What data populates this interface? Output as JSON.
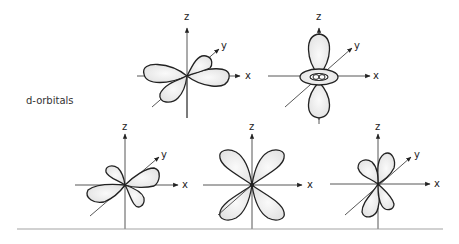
{
  "figure": {
    "side_label": "d-orbitals",
    "baseline_color": "#999999",
    "line_color": "#222222",
    "fill_color": "#eeeeee",
    "orbitals": [
      {
        "id": "d-xy-top",
        "axis_labels": {
          "z": "z",
          "y": "y",
          "x": "x"
        }
      },
      {
        "id": "d-z2",
        "axis_labels": {
          "z": "z",
          "y": "y",
          "x": "x"
        }
      },
      {
        "id": "d-xz",
        "axis_labels": {
          "z": "z",
          "y": "y",
          "x": "x"
        }
      },
      {
        "id": "d-x2-y2",
        "axis_labels": {
          "z": "z",
          "x": "x"
        }
      },
      {
        "id": "d-yz",
        "axis_labels": {
          "z": "z",
          "y": "y",
          "x": "x"
        }
      }
    ]
  }
}
